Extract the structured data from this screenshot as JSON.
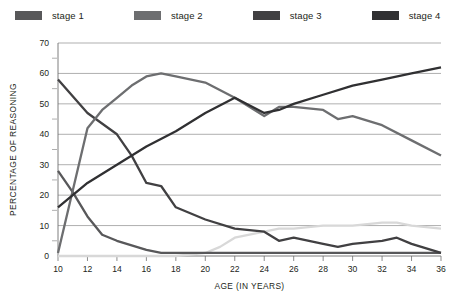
{
  "legend": {
    "items": [
      {
        "label": "stage 1",
        "color": "#58585a"
      },
      {
        "label": "stage 2",
        "color": "#6d6e70"
      },
      {
        "label": "stage 3",
        "color": "#414042"
      },
      {
        "label": "stage 4",
        "color": "#303032"
      },
      {
        "label": "stage 5",
        "color": "#d8d8d8"
      }
    ]
  },
  "chart_data": {
    "type": "line",
    "title": "",
    "xlabel": "AGE (IN YEARS)",
    "ylabel": "PERCENTAGE OF REASONING",
    "x": [
      10,
      12,
      14,
      16,
      18,
      20,
      22,
      24,
      26,
      28,
      30,
      32,
      34,
      36
    ],
    "xlim": [
      10,
      36
    ],
    "ylim": [
      0,
      70
    ],
    "xticks": [
      "10",
      "12",
      "14",
      "16",
      "18",
      "20",
      "22",
      "24",
      "26",
      "28",
      "30",
      "32",
      "34",
      "36"
    ],
    "yticks": [
      "0",
      "10",
      "20",
      "30",
      "40",
      "50",
      "60",
      "70"
    ],
    "ytick_minor_step": 5,
    "grid": true,
    "legend_position": "top",
    "series": [
      {
        "name": "stage 1",
        "color": "#58585a",
        "points": [
          [
            10,
            28
          ],
          [
            11,
            21
          ],
          [
            12,
            13
          ],
          [
            13,
            7
          ],
          [
            14,
            5
          ],
          [
            16,
            2
          ],
          [
            17,
            1
          ],
          [
            18,
            1
          ],
          [
            20,
            1
          ],
          [
            22,
            1
          ],
          [
            24,
            1
          ],
          [
            26,
            1
          ],
          [
            28,
            1
          ],
          [
            30,
            1
          ],
          [
            32,
            1
          ],
          [
            34,
            1
          ],
          [
            36,
            1
          ]
        ]
      },
      {
        "name": "stage 2",
        "color": "#6d6e70",
        "points": [
          [
            10,
            1
          ],
          [
            12,
            42
          ],
          [
            13,
            48
          ],
          [
            14,
            52
          ],
          [
            15,
            56
          ],
          [
            16,
            59
          ],
          [
            17,
            60
          ],
          [
            18,
            59
          ],
          [
            20,
            57
          ],
          [
            22,
            52
          ],
          [
            24,
            46
          ],
          [
            25,
            49
          ],
          [
            26,
            49
          ],
          [
            28,
            48
          ],
          [
            29,
            45
          ],
          [
            30,
            46
          ],
          [
            32,
            43
          ],
          [
            34,
            38
          ],
          [
            36,
            33
          ]
        ]
      },
      {
        "name": "stage 3",
        "color": "#414042",
        "points": [
          [
            10,
            58
          ],
          [
            12,
            47
          ],
          [
            14,
            40
          ],
          [
            15,
            33
          ],
          [
            16,
            24
          ],
          [
            17,
            23
          ],
          [
            18,
            16
          ],
          [
            20,
            12
          ],
          [
            22,
            9
          ],
          [
            24,
            8
          ],
          [
            25,
            5
          ],
          [
            26,
            6
          ],
          [
            28,
            4
          ],
          [
            29,
            3
          ],
          [
            30,
            4
          ],
          [
            32,
            5
          ],
          [
            33,
            6
          ],
          [
            34,
            4
          ],
          [
            36,
            1
          ]
        ]
      },
      {
        "name": "stage 4",
        "color": "#303032",
        "points": [
          [
            10,
            16
          ],
          [
            12,
            24
          ],
          [
            14,
            30
          ],
          [
            16,
            36
          ],
          [
            18,
            41
          ],
          [
            20,
            47
          ],
          [
            22,
            52
          ],
          [
            24,
            47
          ],
          [
            25,
            48
          ],
          [
            26,
            50
          ],
          [
            28,
            53
          ],
          [
            30,
            56
          ],
          [
            32,
            58
          ],
          [
            34,
            60
          ],
          [
            36,
            62
          ]
        ]
      },
      {
        "name": "stage 5",
        "color": "#d8d8d8",
        "points": [
          [
            10,
            0
          ],
          [
            12,
            0
          ],
          [
            14,
            0
          ],
          [
            16,
            0
          ],
          [
            18,
            0
          ],
          [
            20,
            1
          ],
          [
            21,
            3
          ],
          [
            22,
            6
          ],
          [
            24,
            8
          ],
          [
            25,
            9
          ],
          [
            26,
            9
          ],
          [
            28,
            10
          ],
          [
            30,
            10
          ],
          [
            32,
            11
          ],
          [
            33,
            11
          ],
          [
            34,
            10
          ],
          [
            36,
            9
          ]
        ]
      }
    ]
  }
}
